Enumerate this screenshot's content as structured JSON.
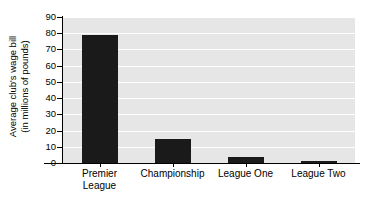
{
  "chart_data": {
    "type": "bar",
    "title": "",
    "xlabel": "",
    "ylabel": "Average club's wage bill (in millions of pounds)",
    "ylabel_lines": [
      "Average club's wage bill",
      "(in millions of pounds)"
    ],
    "categories": [
      "Premier League",
      "Championship",
      "League One",
      "League Two"
    ],
    "category_lines": [
      [
        "Premier",
        "League"
      ],
      [
        "Championship"
      ],
      [
        "League One"
      ],
      [
        "League Two"
      ]
    ],
    "values": [
      79,
      15,
      4,
      1
    ],
    "ylim": [
      0,
      90
    ],
    "ytick_values": [
      0,
      10,
      20,
      30,
      40,
      50,
      60,
      70,
      80,
      90
    ],
    "ytick_labels": [
      "0",
      "10",
      "20",
      "30",
      "40",
      "50",
      "60",
      "70",
      "80",
      "90"
    ],
    "grid": true,
    "grid_axis": "y",
    "legend": false,
    "legend_position": "none",
    "colors": {
      "bar": "#1a1a1a",
      "plot_background": "#e6e6e6",
      "gridline": "#ffffff",
      "axis": "#000000",
      "text": "#000000",
      "page_background": "#ffffff"
    }
  }
}
